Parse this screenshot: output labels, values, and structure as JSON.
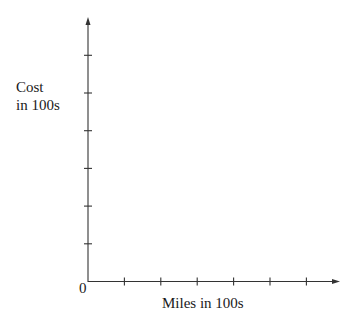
{
  "chart_data": {
    "type": "line",
    "title": "",
    "xlabel": "Miles in 100s",
    "ylabel": [
      "Cost",
      "in 100s"
    ],
    "origin_label": "0",
    "x_ticks": 6,
    "y_ticks": 6,
    "x_tick_labels": [],
    "y_tick_labels": [],
    "series": [],
    "grid": false,
    "legend": null,
    "axes_color": "#333333"
  }
}
